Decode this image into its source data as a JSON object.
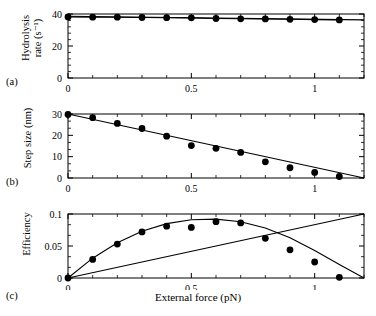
{
  "figure": {
    "xlabel": "External force (pN)",
    "panels": [
      {
        "label": "(a)",
        "ylabel_line1": "Hydrolysis",
        "ylabel_line2": "rate (s⁻¹)"
      },
      {
        "label": "(b)",
        "ylabel_line1": "Step size (nm)",
        "ylabel_line2": ""
      },
      {
        "label": "(c)",
        "ylabel_line1": "Efficiency",
        "ylabel_line2": ""
      }
    ]
  },
  "chart_data": [
    {
      "type": "scatter",
      "panel": "a",
      "title": "",
      "xlabel": "",
      "ylabel": "Hydrolysis rate (s^-1)",
      "xlim": [
        0,
        1.2
      ],
      "ylim": [
        0,
        40
      ],
      "xticks": [
        0,
        0.5,
        1
      ],
      "xtick_labels": [
        "0",
        "0.5",
        "1"
      ],
      "yticks": [
        0,
        20,
        40
      ],
      "ytick_labels": [
        "0",
        "20",
        "40"
      ],
      "grid": false,
      "legend": "none",
      "series": [
        {
          "name": "hydrolysis rate data",
          "style": "markers-with-line",
          "x": [
            0.0,
            0.1,
            0.2,
            0.3,
            0.4,
            0.5,
            0.6,
            0.7,
            0.8,
            0.9,
            1.0,
            1.1
          ],
          "values": [
            38.2,
            38.0,
            38.0,
            37.8,
            37.7,
            37.6,
            37.2,
            37.0,
            36.9,
            36.7,
            36.5,
            36.3
          ]
        },
        {
          "name": "theory curve",
          "style": "line",
          "x": [
            0.0,
            1.2
          ],
          "values": [
            38.6,
            36.3
          ]
        }
      ]
    },
    {
      "type": "scatter",
      "panel": "b",
      "title": "",
      "xlabel": "",
      "ylabel": "Step size (nm)",
      "xlim": [
        0,
        1.2
      ],
      "ylim": [
        0,
        30
      ],
      "xticks": [
        0,
        0.5,
        1
      ],
      "xtick_labels": [
        "0",
        "0.5",
        "1"
      ],
      "yticks": [
        0,
        10,
        20,
        30
      ],
      "ytick_labels": [
        "0",
        "10",
        "20",
        "30"
      ],
      "grid": false,
      "legend": "none",
      "series": [
        {
          "name": "step size data",
          "style": "markers",
          "x": [
            0.0,
            0.1,
            0.2,
            0.3,
            0.4,
            0.5,
            0.6,
            0.7,
            0.8,
            0.9,
            1.0,
            1.1
          ],
          "values": [
            29.8,
            28.3,
            25.6,
            23.2,
            19.6,
            15.2,
            13.9,
            12.0,
            7.6,
            4.8,
            2.6,
            0.7
          ]
        },
        {
          "name": "theory line",
          "style": "line",
          "x": [
            0.0,
            1.2
          ],
          "values": [
            30.0,
            0.0
          ]
        }
      ]
    },
    {
      "type": "scatter",
      "panel": "c",
      "title": "",
      "xlabel": "External force (pN)",
      "ylabel": "Efficiency",
      "xlim": [
        0,
        1.2
      ],
      "ylim": [
        0,
        0.1
      ],
      "xticks": [
        0,
        0.5,
        1
      ],
      "xtick_labels": [
        "0",
        "0.5",
        "1"
      ],
      "yticks": [
        0,
        0.05,
        0.1
      ],
      "ytick_labels": [
        "0",
        "0.05",
        "0.1"
      ],
      "grid": false,
      "legend": "none",
      "series": [
        {
          "name": "efficiency data",
          "style": "markers",
          "x": [
            0.0,
            0.1,
            0.2,
            0.3,
            0.4,
            0.5,
            0.6,
            0.7,
            0.8,
            0.9,
            1.0,
            1.1
          ],
          "values": [
            0.0,
            0.029,
            0.053,
            0.072,
            0.081,
            0.079,
            0.088,
            0.086,
            0.062,
            0.044,
            0.025,
            0.001
          ]
        },
        {
          "name": "efficiency theory curve",
          "style": "line",
          "x": [
            0.0,
            0.1,
            0.2,
            0.3,
            0.4,
            0.5,
            0.6,
            0.7,
            0.8,
            0.9,
            1.0,
            1.1,
            1.2
          ],
          "values": [
            0.0,
            0.031,
            0.055,
            0.073,
            0.085,
            0.091,
            0.092,
            0.088,
            0.078,
            0.063,
            0.043,
            0.021,
            0.0
          ]
        },
        {
          "name": "linear reference line",
          "style": "line",
          "x": [
            0.0,
            1.2
          ],
          "values": [
            0.0,
            0.1
          ]
        }
      ]
    }
  ]
}
